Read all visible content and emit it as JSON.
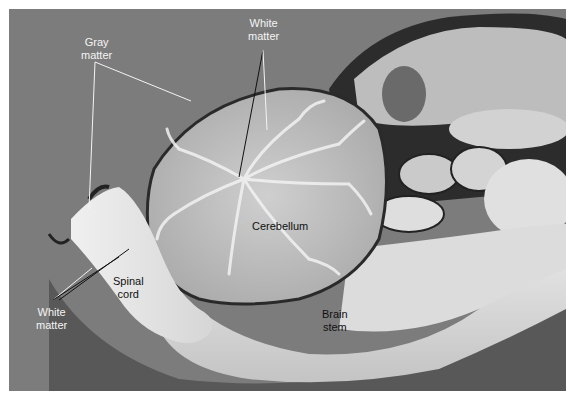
{
  "figure": {
    "background_color": "#7c7c7c",
    "tissue_color": "#d8d8d8",
    "labels": [
      {
        "id": "white-matter-top",
        "lines": [
          "White",
          "matter"
        ],
        "color": "#f4f4f4"
      },
      {
        "id": "gray-matter",
        "lines": [
          "Gray",
          "matter"
        ],
        "color": "#f4f4f4"
      },
      {
        "id": "cerebellum",
        "lines": [
          "Cerebellum"
        ],
        "color": "#111111"
      },
      {
        "id": "spinal-cord",
        "lines": [
          "Spinal",
          "cord"
        ],
        "color": "#111111"
      },
      {
        "id": "white-matter-bottom",
        "lines": [
          "White",
          "matter"
        ],
        "color": "#f4f4f4"
      },
      {
        "id": "brain-stem",
        "lines": [
          "Brain",
          "stem"
        ],
        "color": "#111111"
      }
    ]
  }
}
